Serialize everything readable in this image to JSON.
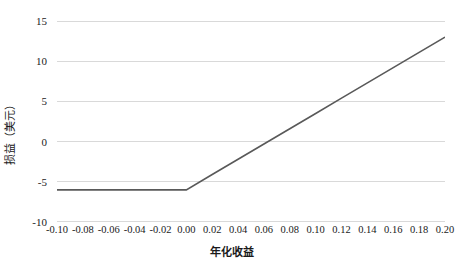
{
  "chart_data": {
    "type": "line",
    "title": "",
    "xlabel": "年化收益",
    "ylabel": "损益（美元）",
    "xlim": [
      -0.1,
      0.2
    ],
    "ylim": [
      -10,
      15
    ],
    "xticks": [
      "-0.10",
      "-0.08",
      "-0.06",
      "-0.04",
      "-0.02",
      "0.00",
      "0.02",
      "0.04",
      "0.06",
      "0.08",
      "0.10",
      "0.12",
      "0.14",
      "0.16",
      "0.18",
      "0.20"
    ],
    "xtick_values": [
      -0.1,
      -0.08,
      -0.06,
      -0.04,
      -0.02,
      0.0,
      0.02,
      0.04,
      0.06,
      0.08,
      0.1,
      0.12,
      0.14,
      0.16,
      0.18,
      0.2
    ],
    "yticks": [
      "15",
      "10",
      "5",
      "0",
      "-5",
      "-10"
    ],
    "ytick_values": [
      15,
      10,
      5,
      0,
      -5,
      -10
    ],
    "grid": "horizontal",
    "legend": "none",
    "series": [
      {
        "name": "损益",
        "color": "#595959",
        "linewidth": 1.6,
        "x": [
          -0.1,
          -0.08,
          -0.06,
          -0.04,
          -0.02,
          0.0,
          0.02,
          0.04,
          0.06,
          0.08,
          0.1,
          0.12,
          0.14,
          0.16,
          0.18,
          0.2
        ],
        "values": [
          -6,
          -6,
          -6,
          -6,
          -6,
          -6,
          -4.1,
          -2.2,
          -0.3,
          1.6,
          3.5,
          5.4,
          7.3,
          9.2,
          11.1,
          13.0
        ]
      }
    ],
    "annotations": {
      "flat_level": -6,
      "kink_x": 0.0,
      "slope_after_kink": 95,
      "end_value": 13
    }
  }
}
